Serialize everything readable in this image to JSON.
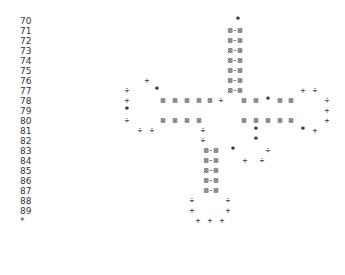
{
  "rows": [
    {
      "label": "70",
      "y": 16,
      "glyphs": [
        {
          "x": 238,
          "ch": "*"
        }
      ]
    },
    {
      "label": "71",
      "y": 26,
      "glyphs": [
        {
          "x": 235,
          "ch": "⊠-⊠"
        }
      ]
    },
    {
      "label": "72",
      "y": 36,
      "glyphs": [
        {
          "x": 235,
          "ch": "⊠-⊠"
        }
      ]
    },
    {
      "label": "73",
      "y": 46,
      "glyphs": [
        {
          "x": 235,
          "ch": "⊠-⊠"
        }
      ]
    },
    {
      "label": "74",
      "y": 56,
      "glyphs": [
        {
          "x": 235,
          "ch": "⊠-⊠"
        }
      ]
    },
    {
      "label": "75",
      "y": 66,
      "glyphs": [
        {
          "x": 235,
          "ch": "⊠-⊠"
        }
      ]
    },
    {
      "label": "76",
      "y": 76,
      "glyphs": [
        {
          "x": 147,
          "ch": "+"
        },
        {
          "x": 235,
          "ch": "⊠-⊠"
        }
      ]
    },
    {
      "label": "77",
      "y": 86,
      "glyphs": [
        {
          "x": 127,
          "ch": "÷"
        },
        {
          "x": 157,
          "ch": "*"
        },
        {
          "x": 235,
          "ch": "⊠-⊠"
        },
        {
          "x": 303,
          "ch": "+"
        },
        {
          "x": 315,
          "ch": "÷"
        }
      ]
    },
    {
      "label": "78",
      "y": 96,
      "glyphs": [
        {
          "x": 127,
          "ch": "+"
        },
        {
          "x": 163,
          "ch": "⊠"
        },
        {
          "x": 175,
          "ch": "⊠"
        },
        {
          "x": 187,
          "ch": "⊠"
        },
        {
          "x": 199,
          "ch": "⊠"
        },
        {
          "x": 210,
          "ch": "⊠"
        },
        {
          "x": 221,
          "ch": "÷"
        },
        {
          "x": 244,
          "ch": "⊠"
        },
        {
          "x": 256,
          "ch": "⊠"
        },
        {
          "x": 268,
          "ch": "*"
        },
        {
          "x": 280,
          "ch": "⊠"
        },
        {
          "x": 291,
          "ch": "⊠"
        },
        {
          "x": 327,
          "ch": "÷"
        }
      ]
    },
    {
      "label": "79",
      "y": 106,
      "glyphs": [
        {
          "x": 127,
          "ch": "*"
        },
        {
          "x": 327,
          "ch": "+"
        }
      ]
    },
    {
      "label": "80",
      "y": 116,
      "glyphs": [
        {
          "x": 127,
          "ch": "÷"
        },
        {
          "x": 163,
          "ch": "⊠"
        },
        {
          "x": 175,
          "ch": "⊠"
        },
        {
          "x": 187,
          "ch": "⊠"
        },
        {
          "x": 199,
          "ch": "⊠"
        },
        {
          "x": 244,
          "ch": "⊠"
        },
        {
          "x": 256,
          "ch": "⊠"
        },
        {
          "x": 268,
          "ch": "⊠"
        },
        {
          "x": 280,
          "ch": "⊠"
        },
        {
          "x": 291,
          "ch": "⊠"
        },
        {
          "x": 327,
          "ch": "+"
        }
      ]
    },
    {
      "label": "81",
      "y": 126,
      "glyphs": [
        {
          "x": 140,
          "ch": "÷"
        },
        {
          "x": 152,
          "ch": "÷"
        },
        {
          "x": 203,
          "ch": "÷"
        },
        {
          "x": 256,
          "ch": "*"
        },
        {
          "x": 303,
          "ch": "*"
        },
        {
          "x": 315,
          "ch": "+"
        }
      ]
    },
    {
      "label": "82",
      "y": 136,
      "glyphs": [
        {
          "x": 203,
          "ch": "÷"
        },
        {
          "x": 256,
          "ch": "*"
        }
      ]
    },
    {
      "label": "83",
      "y": 146,
      "glyphs": [
        {
          "x": 211,
          "ch": "⊠-⊠"
        },
        {
          "x": 233,
          "ch": "*"
        },
        {
          "x": 268,
          "ch": "÷"
        }
      ]
    },
    {
      "label": "84",
      "y": 156,
      "glyphs": [
        {
          "x": 211,
          "ch": "⊠-⊠"
        },
        {
          "x": 245,
          "ch": "+"
        },
        {
          "x": 262,
          "ch": "÷"
        }
      ]
    },
    {
      "label": "85",
      "y": 166,
      "glyphs": [
        {
          "x": 211,
          "ch": "⊠-⊠"
        }
      ]
    },
    {
      "label": "86",
      "y": 176,
      "glyphs": [
        {
          "x": 211,
          "ch": "⊠-⊠"
        }
      ]
    },
    {
      "label": "87",
      "y": 186,
      "glyphs": [
        {
          "x": 211,
          "ch": "⊠-⊠"
        }
      ]
    },
    {
      "label": "88",
      "y": 196,
      "glyphs": [
        {
          "x": 192,
          "ch": "÷"
        },
        {
          "x": 228,
          "ch": "÷"
        }
      ]
    },
    {
      "label": "89",
      "y": 206,
      "glyphs": [
        {
          "x": 192,
          "ch": "+"
        },
        {
          "x": 228,
          "ch": "+"
        }
      ]
    },
    {
      "label": "*",
      "y": 216,
      "glyphs": [
        {
          "x": 198,
          "ch": "+"
        },
        {
          "x": 210,
          "ch": "+"
        },
        {
          "x": 222,
          "ch": "+"
        }
      ]
    }
  ]
}
